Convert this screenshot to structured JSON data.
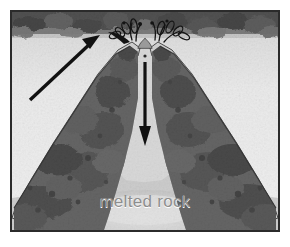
{
  "figure": {
    "caption": "melted rock",
    "frame_color": "#2b2b2b",
    "background_color": "#dedede"
  },
  "labels": {
    "melted_rock": "melted rock"
  },
  "arrows": [
    {
      "name": "magma-rise-arrow",
      "direction": "up-right",
      "x1": 28,
      "y1": 96,
      "x2": 93,
      "y2": 36,
      "color": "#111111",
      "meaning": "melted rock rising toward vent"
    },
    {
      "name": "conduit-flow-arrow",
      "direction": "down",
      "x1": 146,
      "y1": 58,
      "x2": 146,
      "y2": 136,
      "color": "#111111",
      "meaning": "flow down central conduit"
    }
  ],
  "regions": [
    {
      "name": "seawater-sediment-band",
      "tone": "#4a4a4a",
      "position": "top"
    },
    {
      "name": "left-volcano-flank",
      "tone": "#5b5b5b"
    },
    {
      "name": "right-volcano-flank",
      "tone": "#5b5b5b"
    },
    {
      "name": "central-conduit",
      "tone": "#d9d9d9"
    },
    {
      "name": "magma-chamber",
      "tone": "#cfcfcf",
      "position": "bottom"
    },
    {
      "name": "eruption-spray",
      "tone": "#1a1a1a",
      "position": "vent"
    }
  ],
  "colors": {
    "ink": "#111111",
    "dark_rock": "#4f4f4f",
    "mid_rock": "#6e6e6e",
    "light_crust": "#c9c9c9",
    "magma": "#d4d4d4",
    "water": "#ededed",
    "caption_text": "#8e8e8e"
  }
}
